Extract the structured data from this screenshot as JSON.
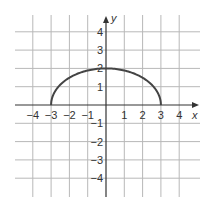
{
  "chart_data": {
    "type": "line",
    "title": "",
    "xlabel": "x",
    "ylabel": "y",
    "xlim": [
      -4.5,
      4.5
    ],
    "ylim": [
      -4.5,
      4.5
    ],
    "grid": true,
    "x_ticks": [
      -4,
      -3,
      -2,
      -1,
      1,
      2,
      3,
      4
    ],
    "y_ticks": [
      4,
      3,
      2,
      1,
      -1,
      -2,
      -3,
      -4
    ],
    "x_tick_labels": [
      "−4",
      "−3",
      "−2",
      "−1",
      "1",
      "2",
      "3",
      "4"
    ],
    "y_tick_labels": [
      "4",
      "3",
      "2",
      "1",
      "−1",
      "−2",
      "−3",
      "−4"
    ],
    "series": [
      {
        "name": "upper semi-ellipse",
        "description": "Upper half of x²/9 + y²/4 = 1",
        "x": [
          -3,
          -2.5,
          -2,
          -1.5,
          -1,
          -0.5,
          0,
          0.5,
          1,
          1.5,
          2,
          2.5,
          3
        ],
        "y": [
          0,
          1.11,
          1.49,
          1.73,
          1.89,
          1.97,
          2,
          1.97,
          1.89,
          1.73,
          1.49,
          1.11,
          0
        ],
        "color": "#444444"
      }
    ],
    "legend": null
  },
  "colors": {
    "grid": "#b8b8b8",
    "axis": "#333333",
    "curve": "#444444"
  }
}
